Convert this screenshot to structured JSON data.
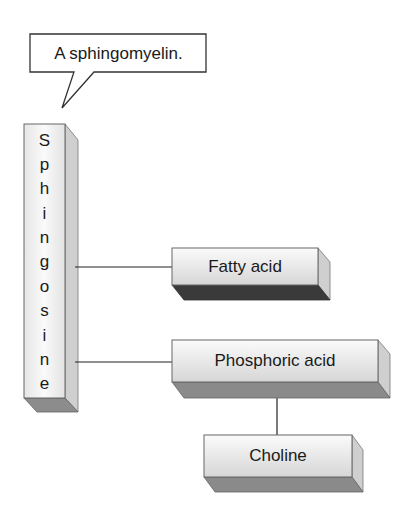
{
  "callout": {
    "text": "A sphingomyelin."
  },
  "backbone": {
    "label": "Sphingosine",
    "letters": [
      "S",
      "p",
      "h",
      "i",
      "n",
      "g",
      "o",
      "s",
      "i",
      "n",
      "e"
    ]
  },
  "components": {
    "fatty_acid": "Fatty acid",
    "phosphoric_acid": "Phosphoric acid",
    "choline": "Choline"
  },
  "colors": {
    "face_light": "#f4f4f4",
    "face_gradient_end": "#d9d9d9",
    "side": "#c8c8c8",
    "bottom": "#8a8a8a",
    "outline": "#555555",
    "line": "#222222"
  }
}
